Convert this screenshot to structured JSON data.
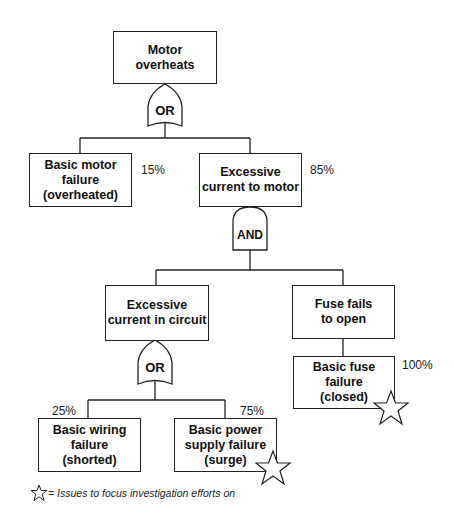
{
  "diagram": {
    "type": "fault-tree",
    "top_event": {
      "label": "Motor\noverheats"
    },
    "gates": [
      {
        "id": "gate1",
        "type": "OR",
        "label": "OR"
      },
      {
        "id": "gate2",
        "type": "AND",
        "label": "AND"
      },
      {
        "id": "gate3",
        "type": "OR",
        "label": "OR"
      }
    ],
    "events": {
      "basic_motor": {
        "label": "Basic motor\nfailure\n(overheated)",
        "pct": "15%"
      },
      "excessive_motor": {
        "label": "Excessive\ncurrent to motor",
        "pct": "85%"
      },
      "excessive_circuit": {
        "label": "Excessive\ncurrent in circuit"
      },
      "fuse_fails": {
        "label": "Fuse fails\nto open"
      },
      "fuse_failure": {
        "label": "Basic fuse failure\n(closed)",
        "pct": "100%",
        "starred": true
      },
      "wiring": {
        "label": "Basic wiring\nfailure\n(shorted)",
        "pct": "25%"
      },
      "power": {
        "label": "Basic power\nsupply failure\n(surge)",
        "pct": "75%",
        "starred": true
      }
    },
    "legend": {
      "text": "= Issues to focus investigation efforts on",
      "icon": "star-icon"
    }
  }
}
